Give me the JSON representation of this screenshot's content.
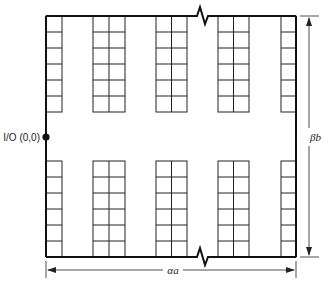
{
  "diagram": {
    "type": "warehouse-layout",
    "io_label": "I/O (0,0)",
    "width_label": "αa",
    "height_label": "βb",
    "width_label_parts": {
      "greek": "α",
      "var": "a"
    },
    "height_label_parts": {
      "greek": "β",
      "var": "b"
    },
    "colors": {
      "line": "#111111",
      "background": "#ffffff"
    },
    "boundary": {
      "left": 46,
      "top": 16,
      "right": 296,
      "bottom": 257
    },
    "rack_blocks": [
      {
        "name": "top",
        "y": 16,
        "rows": 6,
        "row_height": 16
      },
      {
        "name": "bottom",
        "y": 161,
        "rows": 6,
        "row_height": 16
      }
    ],
    "rack_columns": [
      {
        "x": 46,
        "cells": 1,
        "cell_width": 16
      },
      {
        "x": 93,
        "cells": 2,
        "cell_width": 16
      },
      {
        "x": 156,
        "cells": 2,
        "cell_width": 15.5
      },
      {
        "x": 218,
        "cells": 2,
        "cell_width": 15.5
      },
      {
        "x": 281,
        "cells": 1,
        "cell_width": 15
      }
    ],
    "io_point": {
      "x": 46,
      "y": 137
    }
  }
}
